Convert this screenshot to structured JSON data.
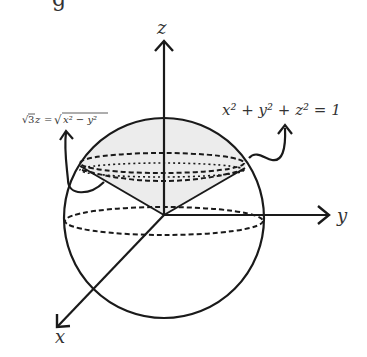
{
  "figure": {
    "partial_heading_glyph": "g",
    "axes": {
      "z_label": "z",
      "y_label": "y",
      "x_label": "x"
    },
    "annotations": {
      "cone_equation": "√3z = √(x² − y²)",
      "cone_lhs": "√3z",
      "cone_eq": "=",
      "cone_rhs": "x² − y²",
      "sphere_equation": "x² + y² + z² = 1"
    },
    "colors": {
      "stroke": "#1a1a1a",
      "shaded_region": "#ececec",
      "background": "#ffffff"
    }
  }
}
